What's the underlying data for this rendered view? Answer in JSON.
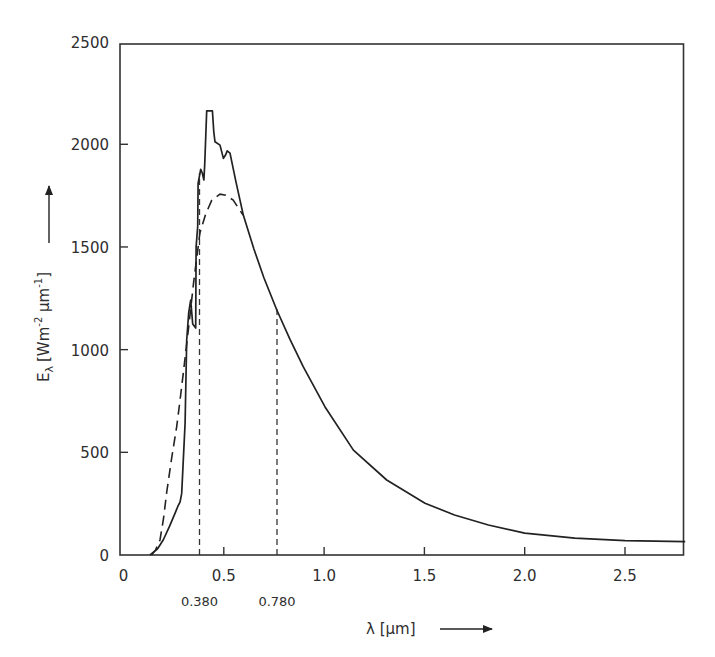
{
  "chart_data": {
    "type": "line",
    "title": "",
    "xlabel": "λ [µm]",
    "ylabel": "Eλ [Wm⁻² µm⁻¹]",
    "xlim": [
      0,
      2.8
    ],
    "ylim": [
      0,
      2500
    ],
    "grid": false,
    "legend": null,
    "x_ticks": [
      {
        "value": 0,
        "label": "0"
      },
      {
        "value": 0.5,
        "label": "0.5"
      },
      {
        "value": 1.0,
        "label": "1.0"
      },
      {
        "value": 1.5,
        "label": "1.5"
      },
      {
        "value": 2.0,
        "label": "2.0"
      },
      {
        "value": 2.5,
        "label": "2.5"
      }
    ],
    "y_ticks": [
      {
        "value": 0,
        "label": "0"
      },
      {
        "value": 500,
        "label": "500"
      },
      {
        "value": 1000,
        "label": "1000"
      },
      {
        "value": 1500,
        "label": "1500"
      },
      {
        "value": 2000,
        "label": "2000"
      },
      {
        "value": 2500,
        "label": "2500"
      }
    ],
    "annotations": [
      {
        "x": 0.38,
        "label": "0.380",
        "style": "dashed-vertical"
      },
      {
        "x": 0.78,
        "label": "0.780",
        "style": "dashed-vertical"
      }
    ],
    "series": [
      {
        "name": "Measured solar spectral irradiance",
        "style": "solid",
        "x": [
          0.132,
          0.17,
          0.198,
          0.23,
          0.257,
          0.27,
          0.282,
          0.29,
          0.298,
          0.307,
          0.315,
          0.325,
          0.335,
          0.345,
          0.36,
          0.362,
          0.37,
          0.372,
          0.385,
          0.393,
          0.401,
          0.405,
          0.415,
          0.443,
          0.45,
          0.456,
          0.481,
          0.498,
          0.51,
          0.517,
          0.531,
          0.56,
          0.597,
          0.65,
          0.7,
          0.764,
          0.83,
          0.896,
          1.004,
          1.146,
          1.312,
          1.503,
          1.65,
          1.819,
          2.0,
          2.25,
          2.5,
          2.8
        ],
        "y": [
          0,
          30,
          73,
          140,
          204,
          235,
          259,
          300,
          462,
          643,
          1047,
          1180,
          1241,
          1125,
          1105,
          1500,
          1600,
          1810,
          1878,
          1860,
          1826,
          1900,
          2163,
          2163,
          2060,
          2012,
          1996,
          1931,
          1950,
          1968,
          1957,
          1820,
          1655,
          1490,
          1350,
          1193,
          1050,
          917,
          722,
          511,
          365,
          252,
          195,
          146,
          106,
          82,
          70,
          65
        ]
      },
      {
        "name": "Blackbody approximation",
        "style": "dashed",
        "x": [
          0.14,
          0.16,
          0.182,
          0.2,
          0.215,
          0.24,
          0.265,
          0.28,
          0.298,
          0.323,
          0.35,
          0.381,
          0.41,
          0.44,
          0.481,
          0.51,
          0.547,
          0.596
        ],
        "y": [
          0,
          25,
          73,
          180,
          302,
          470,
          625,
          740,
          886,
          1095,
          1330,
          1568,
          1660,
          1728,
          1757,
          1752,
          1728,
          1655
        ]
      }
    ]
  },
  "labels": {
    "y_axis_title_main": "E",
    "y_axis_title_sub": "λ",
    "y_axis_title_units": "[Wm",
    "y_axis_title_exp1": "-2",
    "y_axis_title_mid": " µm",
    "y_axis_title_exp2": "-1",
    "y_axis_title_close": "]",
    "x_axis_title": "λ [µm]"
  }
}
